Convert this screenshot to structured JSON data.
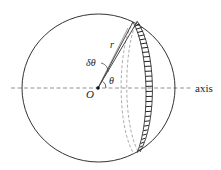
{
  "diagram": {
    "labels": {
      "center": "O",
      "radius": "r",
      "delta_theta": "δθ",
      "theta": "θ",
      "axis": "axis"
    },
    "colors": {
      "stroke": "#333333",
      "dashed": "#777777",
      "hatch": "#222222",
      "background": "#ffffff"
    }
  }
}
